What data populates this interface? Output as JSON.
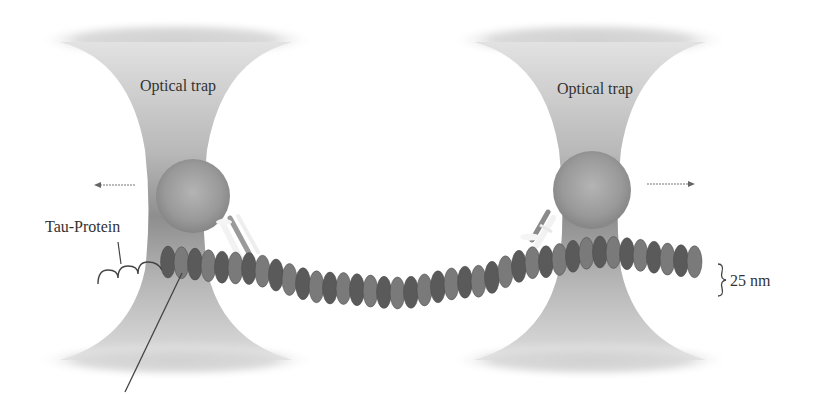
{
  "figure": {
    "traps": [
      {
        "label": "Optical trap",
        "side": "left",
        "force_direction": "left"
      },
      {
        "label": "Optical trap",
        "side": "right",
        "force_direction": "right"
      }
    ],
    "labels": {
      "tau_protein": "Tau-Protein",
      "diameter": "25 nm"
    },
    "colors": {
      "trap_light": "#d9d9d9",
      "trap_dark": "#8c8c8c",
      "bead": "#9a9a9a",
      "tubulin_dark": "#5a5a5a",
      "tubulin_light": "#7a7a7a",
      "text": "#333333"
    }
  }
}
